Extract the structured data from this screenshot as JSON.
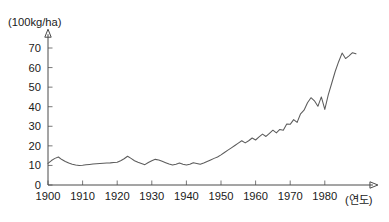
{
  "chart_data": {
    "type": "line",
    "title": "",
    "ylabel": "(100kg/ha)",
    "xlabel": "(연도)",
    "xlim": [
      1900,
      1990
    ],
    "ylim": [
      0,
      75
    ],
    "grid": false,
    "legend": null,
    "y_ticks": [
      0,
      10,
      20,
      30,
      40,
      50,
      60,
      70
    ],
    "y_tick_labels": [
      "0",
      "10",
      "20",
      "30",
      "40",
      "50",
      "60",
      "70"
    ],
    "x_ticks": [
      1900,
      1910,
      1920,
      1930,
      1940,
      1950,
      1960,
      1970,
      1980
    ],
    "x_tick_labels": [
      "1900",
      "1910",
      "1920",
      "1930",
      "1940",
      "1950",
      "1960",
      "1970",
      "1980"
    ],
    "series": [
      {
        "name": "yield",
        "color": "#5c5c5c",
        "x": [
          1900,
          1901,
          1902,
          1903,
          1904,
          1905,
          1906,
          1907,
          1908,
          1909,
          1910,
          1911,
          1912,
          1913,
          1914,
          1915,
          1916,
          1917,
          1918,
          1919,
          1920,
          1921,
          1922,
          1923,
          1924,
          1925,
          1926,
          1927,
          1928,
          1929,
          1930,
          1931,
          1932,
          1933,
          1934,
          1935,
          1936,
          1937,
          1938,
          1939,
          1940,
          1941,
          1942,
          1943,
          1944,
          1945,
          1946,
          1947,
          1948,
          1949,
          1950,
          1951,
          1952,
          1953,
          1954,
          1955,
          1956,
          1957,
          1958,
          1959,
          1960,
          1961,
          1962,
          1963,
          1964,
          1965,
          1966,
          1967,
          1968,
          1969,
          1970,
          1971,
          1972,
          1973,
          1974,
          1975,
          1976,
          1977,
          1978,
          1979,
          1980,
          1981,
          1982,
          1983,
          1984,
          1985,
          1986,
          1987,
          1988,
          1989
        ],
        "y": [
          11.0,
          12.5,
          13.6,
          14.3,
          13.0,
          12.0,
          11.2,
          10.6,
          10.2,
          10.0,
          10.1,
          10.3,
          10.5,
          10.7,
          10.9,
          11.0,
          11.1,
          11.2,
          11.3,
          11.5,
          11.6,
          12.4,
          13.4,
          14.7,
          13.6,
          12.4,
          11.6,
          11.0,
          10.4,
          11.5,
          12.4,
          13.1,
          12.8,
          12.1,
          11.4,
          10.7,
          10.2,
          10.6,
          11.2,
          10.6,
          10.2,
          10.6,
          11.4,
          11.0,
          10.6,
          11.2,
          12.0,
          12.8,
          13.6,
          14.3,
          15.4,
          16.6,
          17.8,
          19.0,
          20.2,
          21.4,
          22.6,
          21.5,
          22.6,
          24.0,
          23.0,
          24.6,
          26.0,
          24.8,
          26.4,
          28.0,
          26.6,
          28.4,
          28.0,
          31.2,
          31.0,
          33.4,
          32.0,
          36.4,
          38.2,
          42.0,
          44.6,
          43.0,
          40.2,
          45.0,
          38.6,
          46.0,
          52.0,
          58.0,
          63.0,
          67.4,
          64.6,
          66.0,
          67.6,
          67.0
        ]
      }
    ]
  },
  "axis": {
    "y_title": "(100kg/ha)",
    "x_title": "(연도)"
  }
}
